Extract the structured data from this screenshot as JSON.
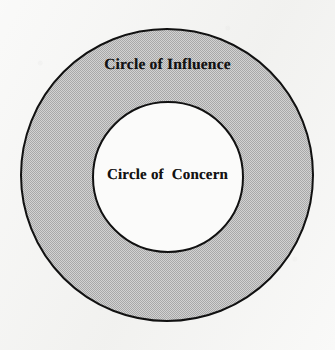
{
  "diagram": {
    "type": "concentric-circles",
    "background_color": "#f3f3f1",
    "outline_color": "#111111",
    "outline_width_px": 2,
    "outer_circle": {
      "name": "circle-of-influence",
      "label": "Circle of Influence",
      "fill_color": "#bfbfbf",
      "fill_style": "halftone-dither-gray",
      "center_x": 167,
      "center_y": 175,
      "diameter_px": 295
    },
    "inner_circle": {
      "name": "circle-of-concern",
      "label": "Circle of  Concern",
      "fill_color": "#ffffff",
      "fill_style": "solid-white",
      "center_x": 168,
      "center_y": 177,
      "diameter_px": 152
    }
  }
}
